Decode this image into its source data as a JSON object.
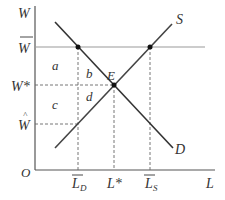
{
  "diagram": {
    "axes": {
      "y_label": "W",
      "x_label": "L",
      "origin_label": "O"
    },
    "curves": {
      "supply_label": "S",
      "demand_label": "D"
    },
    "equilibrium_label": "E",
    "y_ticks": {
      "w_bar": "W",
      "w_star": "W*",
      "w_hat": "W"
    },
    "x_ticks": {
      "l_d": "L",
      "l_d_sub": "D",
      "l_star": "L*",
      "l_s": "L",
      "l_s_sub": "S"
    },
    "regions": {
      "a": "a",
      "b": "b",
      "c": "c",
      "d": "d"
    },
    "colors": {
      "curve": "#333333",
      "grid_line": "#999999",
      "dashed": "#666666"
    }
  }
}
